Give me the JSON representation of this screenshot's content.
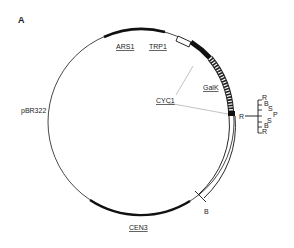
{
  "figure": {
    "panel_label": "A",
    "elements": {
      "ars1": "ARS1",
      "trp1": "TRP1",
      "galk": "GalK",
      "cyc1": "CYC1",
      "pbr322": "pBR322",
      "cen3": "CEN3",
      "site_r": "R",
      "site_b": "B"
    },
    "polylinker": {
      "sites": [
        "R",
        "B",
        "S",
        "P",
        "S",
        "B",
        "R"
      ]
    }
  }
}
